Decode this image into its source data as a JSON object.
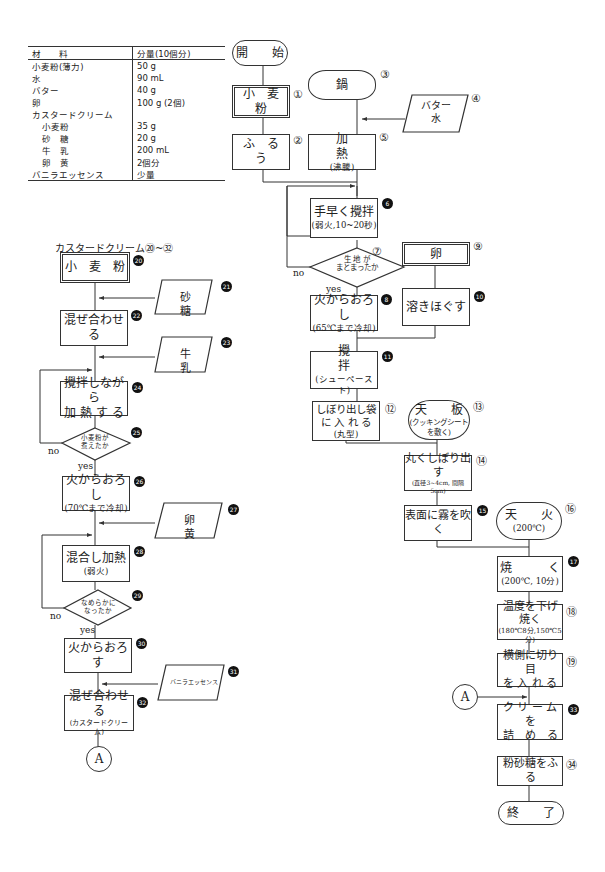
{
  "ingredients_table": {
    "headers": [
      "材　　料",
      "分量(10個分)"
    ],
    "rows": [
      {
        "name": "小麦粉(薄力)",
        "amount": "50 g",
        "indent": false
      },
      {
        "name": "水",
        "amount": "90 mL",
        "indent": false
      },
      {
        "name": "バター",
        "amount": "40 g",
        "indent": false
      },
      {
        "name": "卵",
        "amount": "100 g (2個)",
        "indent": false
      },
      {
        "name": "カスタードクリーム",
        "amount": "",
        "indent": false
      },
      {
        "name": "小麦粉",
        "amount": "35 g",
        "indent": true
      },
      {
        "name": "砂　糖",
        "amount": "20 g",
        "indent": true
      },
      {
        "name": "牛　乳",
        "amount": "200 mL",
        "indent": true
      },
      {
        "name": "卵　黄",
        "amount": "2個分",
        "indent": true
      },
      {
        "name": "バニラエッセンス",
        "amount": "少量",
        "indent": false
      }
    ]
  },
  "main_flow": {
    "start": "開　　始",
    "s1": {
      "num": "①",
      "text": "小　麦　粉"
    },
    "s2": {
      "num": "②",
      "text": "ふ　る　う"
    },
    "s3": {
      "num": "③",
      "text": "鍋"
    },
    "s4": {
      "num": "④",
      "line1": "バター",
      "line2": "水"
    },
    "s5": {
      "num": "⑤",
      "text": "加　　　　熱",
      "sub": "(沸騰)"
    },
    "s6": {
      "num": "6",
      "text": "手早く攪拌",
      "sub": "(弱火,10~20秒)"
    },
    "s7": {
      "num": "⑦",
      "line1": "生 地 が",
      "line2": "まとまったか",
      "no": "no",
      "yes": "yes"
    },
    "s8": {
      "num": "8",
      "text": "火からおろし",
      "sub": "(65℃まで冷却)"
    },
    "s9": {
      "num": "⑨",
      "text": "卵"
    },
    "s10": {
      "num": "10",
      "text": "溶きほぐす"
    },
    "s11": {
      "num": "11",
      "text": "攪　　　　拌",
      "sub": "(シューペースト)"
    },
    "s12": {
      "num": "⑫",
      "line1": "しぼり出し袋",
      "line2": "に 入 れ る",
      "sub": "(丸型)"
    },
    "s13": {
      "num": "⑬",
      "text": "天　　板",
      "sub1": "(クッキングシート",
      "sub2": "を敷く)"
    },
    "s14": {
      "num": "⑭",
      "text": "丸くしぼり出す",
      "sub": "(直径3~4cm, 間隔5cm)"
    },
    "s15": {
      "num": "15",
      "text": "表面に霧を吹く"
    },
    "s16": {
      "num": "⑯",
      "text": "天　　火",
      "sub": "(200℃)"
    },
    "s17": {
      "num": "17",
      "text": "焼　　　く",
      "sub": "(200℃, 10分)"
    },
    "s18": {
      "num": "⑱",
      "text": "温度を下げ焼く",
      "sub": "(180℃8分,150℃5分)"
    },
    "s19": {
      "num": "⑲",
      "line1": "横側に切り目",
      "line2": "を 入 れ る"
    },
    "connector": "A",
    "s33": {
      "num": "33",
      "line1": "ク リ ー ム を",
      "line2": "詰　め　る"
    },
    "s34": {
      "num": "㉞",
      "text": "粉砂糖をふる"
    },
    "end": "終　　了"
  },
  "custard_flow": {
    "title": "カスタードクリーム⑳~㉜",
    "s20": {
      "num": "20",
      "text": "小　麦　粉"
    },
    "s21": {
      "num": "21",
      "text": "砂　　　糖"
    },
    "s22": {
      "num": "22",
      "text": "混ぜ合わせる"
    },
    "s23": {
      "num": "23",
      "text": "牛　　　乳"
    },
    "s24": {
      "num": "24",
      "line1": "攪拌しながら",
      "line2": "加 熱 す る"
    },
    "s25": {
      "num": "25",
      "line1": "小麦粉が",
      "line2": "煮えたか",
      "no": "no",
      "yes": "yes"
    },
    "s26": {
      "num": "26",
      "text": "火からおろし",
      "sub": "(70℃まで冷却)"
    },
    "s27": {
      "num": "27",
      "text": "卵　　　黄"
    },
    "s28": {
      "num": "28",
      "text": "混合し加熱",
      "sub": "(弱火)"
    },
    "s29": {
      "num": "29",
      "line1": "なめらかに",
      "line2": "なったか",
      "no": "no",
      "yes": "yes"
    },
    "s30": {
      "num": "30",
      "text": "火からおろす"
    },
    "s31": {
      "num": "31",
      "text": "バニラエッセンス"
    },
    "s32": {
      "num": "32",
      "text": "混ぜ合わせる",
      "sub": "(カスタードクリーム)"
    },
    "connector": "A"
  }
}
